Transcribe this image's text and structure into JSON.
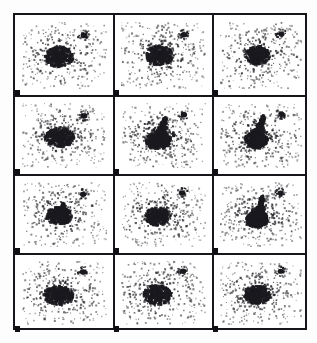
{
  "figure": {
    "kind": "astronomical-image-panel-grid",
    "width_px": 317,
    "height_px": 343,
    "background_color": "#ffffff",
    "ink_color": "#15151a",
    "frame": {
      "left_px": 13,
      "top_px": 13,
      "width_px": 294,
      "height_px": 317,
      "border_width_px": 2
    },
    "grid": {
      "columns": 3,
      "rows": 4,
      "panel_count": 12,
      "column_edges_px": [
        13,
        112,
        211,
        307
      ],
      "row_edges_px": [
        13,
        94,
        173,
        252,
        330
      ],
      "corner_tick_size_px": [
        5,
        6
      ],
      "corner_tick_color": "#101014"
    }
  },
  "chart_data": {
    "type": "scatter",
    "title": "",
    "subtitle": "",
    "xlabel": "",
    "ylabel": "",
    "grid": false,
    "legend": "none",
    "layout": {
      "panels_across": 3,
      "panels_down": 4,
      "shared_axes": true,
      "axis_ticks_shown": false,
      "tick_labels_shown": false
    },
    "panels": [
      {
        "index": 0,
        "row": 1,
        "column": 1,
        "label": "",
        "core": {
          "cx": 0.44,
          "cy": 0.52,
          "rx": 0.095,
          "ry": 0.085,
          "density": "high"
        },
        "halo": {
          "cx": 0.45,
          "cy": 0.5,
          "rx": 0.33,
          "ry": 0.33,
          "points": 230
        },
        "companion": {
          "cx": 0.73,
          "cy": 0.2,
          "r": 0.035
        },
        "plume": null,
        "morphology": "compact round core with diffuse halo"
      },
      {
        "index": 1,
        "row": 1,
        "column": 2,
        "label": "",
        "core": {
          "cx": 0.45,
          "cy": 0.5,
          "rx": 0.09,
          "ry": 0.085,
          "density": "high"
        },
        "halo": {
          "cx": 0.46,
          "cy": 0.5,
          "rx": 0.34,
          "ry": 0.34,
          "points": 245
        },
        "companion": {
          "cx": 0.74,
          "cy": 0.19,
          "r": 0.033
        },
        "plume": null,
        "morphology": "compact round core with diffuse halo"
      },
      {
        "index": 2,
        "row": 1,
        "column": 3,
        "label": "",
        "core": {
          "cx": 0.46,
          "cy": 0.5,
          "rx": 0.085,
          "ry": 0.08,
          "density": "high"
        },
        "halo": {
          "cx": 0.47,
          "cy": 0.49,
          "rx": 0.33,
          "ry": 0.33,
          "points": 235
        },
        "companion": {
          "cx": 0.75,
          "cy": 0.18,
          "r": 0.033
        },
        "plume": null,
        "morphology": "compact core, slight extension toward companion"
      },
      {
        "index": 3,
        "row": 2,
        "column": 1,
        "label": "",
        "core": {
          "cx": 0.44,
          "cy": 0.53,
          "rx": 0.1,
          "ry": 0.085,
          "density": "high"
        },
        "halo": {
          "cx": 0.45,
          "cy": 0.51,
          "rx": 0.33,
          "ry": 0.33,
          "points": 240
        },
        "companion": {
          "cx": 0.73,
          "cy": 0.2,
          "r": 0.034
        },
        "plume": null,
        "morphology": "dense core, faint bridge toward companion"
      },
      {
        "index": 4,
        "row": 2,
        "column": 2,
        "label": "",
        "core": {
          "cx": 0.44,
          "cy": 0.58,
          "rx": 0.085,
          "ry": 0.075,
          "density": "high"
        },
        "halo": {
          "cx": 0.46,
          "cy": 0.52,
          "rx": 0.34,
          "ry": 0.34,
          "points": 250
        },
        "companion": {
          "cx": 0.74,
          "cy": 0.18,
          "r": 0.033
        },
        "plume": {
          "from": [
            0.44,
            0.58
          ],
          "to": [
            0.52,
            0.24
          ],
          "width": 0.055,
          "strength": "strong"
        },
        "morphology": "core with prominent upward tidal plume"
      },
      {
        "index": 5,
        "row": 2,
        "column": 3,
        "label": "",
        "core": {
          "cx": 0.44,
          "cy": 0.57,
          "rx": 0.08,
          "ry": 0.075,
          "density": "high"
        },
        "halo": {
          "cx": 0.46,
          "cy": 0.51,
          "rx": 0.33,
          "ry": 0.33,
          "points": 245
        },
        "companion": {
          "cx": 0.75,
          "cy": 0.17,
          "r": 0.033
        },
        "plume": {
          "from": [
            0.44,
            0.57
          ],
          "to": [
            0.53,
            0.21
          ],
          "width": 0.05,
          "strength": "strong"
        },
        "morphology": "core with prominent upward tidal plume"
      },
      {
        "index": 6,
        "row": 3,
        "column": 1,
        "label": "",
        "core": {
          "cx": 0.44,
          "cy": 0.52,
          "rx": 0.085,
          "ry": 0.075,
          "density": "high"
        },
        "halo": {
          "cx": 0.45,
          "cy": 0.5,
          "rx": 0.33,
          "ry": 0.33,
          "points": 235
        },
        "companion": {
          "cx": 0.72,
          "cy": 0.19,
          "r": 0.033
        },
        "plume": {
          "from": [
            0.44,
            0.52
          ],
          "to": [
            0.49,
            0.34
          ],
          "width": 0.04,
          "strength": "weak"
        },
        "morphology": "core with short upward extension"
      },
      {
        "index": 7,
        "row": 3,
        "column": 2,
        "label": "",
        "core": {
          "cx": 0.43,
          "cy": 0.53,
          "rx": 0.085,
          "ry": 0.08,
          "density": "high"
        },
        "halo": {
          "cx": 0.45,
          "cy": 0.5,
          "rx": 0.33,
          "ry": 0.33,
          "points": 240
        },
        "companion": {
          "cx": 0.72,
          "cy": 0.17,
          "r": 0.033
        },
        "plume": null,
        "morphology": "compact round core with diffuse halo"
      },
      {
        "index": 8,
        "row": 3,
        "column": 3,
        "label": "",
        "core": {
          "cx": 0.45,
          "cy": 0.58,
          "rx": 0.075,
          "ry": 0.07,
          "density": "high"
        },
        "halo": {
          "cx": 0.46,
          "cy": 0.51,
          "rx": 0.33,
          "ry": 0.33,
          "points": 245
        },
        "companion": {
          "cx": 0.74,
          "cy": 0.17,
          "r": 0.033
        },
        "plume": {
          "from": [
            0.45,
            0.58
          ],
          "to": [
            0.52,
            0.23
          ],
          "width": 0.05,
          "strength": "strong"
        },
        "morphology": "core with prominent upward tidal plume"
      },
      {
        "index": 9,
        "row": 4,
        "column": 1,
        "label": "",
        "core": {
          "cx": 0.43,
          "cy": 0.54,
          "rx": 0.1,
          "ry": 0.085,
          "density": "high"
        },
        "halo": {
          "cx": 0.45,
          "cy": 0.51,
          "rx": 0.34,
          "ry": 0.34,
          "points": 240
        },
        "companion": {
          "cx": 0.72,
          "cy": 0.17,
          "r": 0.034
        },
        "plume": null,
        "morphology": "large dense core with diffuse halo"
      },
      {
        "index": 10,
        "row": 4,
        "column": 2,
        "label": "",
        "core": {
          "cx": 0.43,
          "cy": 0.53,
          "rx": 0.095,
          "ry": 0.085,
          "density": "high"
        },
        "halo": {
          "cx": 0.45,
          "cy": 0.5,
          "rx": 0.34,
          "ry": 0.34,
          "points": 245
        },
        "companion": {
          "cx": 0.73,
          "cy": 0.16,
          "r": 0.033
        },
        "plume": null,
        "morphology": "large dense core with diffuse halo"
      },
      {
        "index": 11,
        "row": 4,
        "column": 3,
        "label": "",
        "core": {
          "cx": 0.45,
          "cy": 0.53,
          "rx": 0.09,
          "ry": 0.08,
          "density": "high"
        },
        "halo": {
          "cx": 0.46,
          "cy": 0.5,
          "rx": 0.33,
          "ry": 0.33,
          "points": 240
        },
        "companion": {
          "cx": 0.74,
          "cy": 0.16,
          "r": 0.033
        },
        "plume": null,
        "morphology": "dense core with diffuse halo"
      }
    ]
  }
}
